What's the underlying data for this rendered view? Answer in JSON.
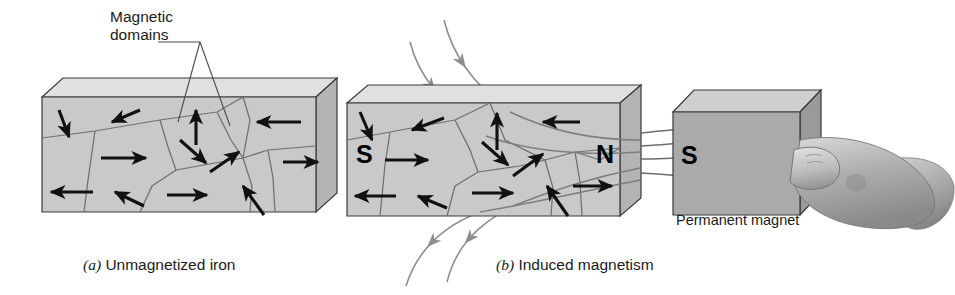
{
  "figure": {
    "width": 955,
    "height": 295,
    "background": "#ffffff"
  },
  "labels": {
    "magnetic_domains": "Magnetic\ndomains",
    "permanent_magnet": "Permanent magnet"
  },
  "captions": {
    "panel_a_index": "(a)",
    "panel_a_text": "Unmagnetized iron",
    "panel_b_index": "(b)",
    "panel_b_text": "Induced magnetism"
  },
  "poles": {
    "block_left": "S",
    "block_right": "N",
    "magnet_left": "S"
  },
  "colors": {
    "front_face": "#c9c9c9",
    "front_face_light": "#d8d8d8",
    "top_face": "#e0e0e0",
    "side_face": "#b4b4b4",
    "magnet_front": "#aaaaaa",
    "magnet_top": "#cfcfcf",
    "magnet_side": "#9a9a9a",
    "domain_line": "#6f6f6f",
    "arrow": "#111111",
    "field_line": "#8d8d8d",
    "hand_light": "#cfcfcf",
    "hand_mid": "#a8a8a8",
    "hand_dark": "#808080",
    "outline": "#3a3a3a",
    "text": "#1a1a1a"
  },
  "panel_a": {
    "name": "unmagnetized-iron-block",
    "block": {
      "front": "42,97 316,97 316,212 42,212",
      "top": "42,97 63,78 337,78 316,97",
      "side": "316,97 337,78 337,193 316,212"
    },
    "domain_lines": [
      "42,138 95,131 160,120 217,112 243,97",
      "95,131 88,180 84,212",
      "160,120 168,147 176,170",
      "176,170 152,186 140,212",
      "176,170 215,163 243,158",
      "217,112 231,140 243,158",
      "243,158 268,150 316,146",
      "243,158 252,186 250,212",
      "268,150 273,178 275,212",
      "243,97 250,120 243,158"
    ],
    "arrows": [
      {
        "name": "domain-arrow-down-left",
        "x1": 59,
        "y1": 110,
        "x2": 69,
        "y2": 137
      },
      {
        "name": "domain-arrow-up-left",
        "x1": 140,
        "y1": 110,
        "x2": 112,
        "y2": 122
      },
      {
        "name": "domain-arrow-up",
        "x1": 196,
        "y1": 145,
        "x2": 196,
        "y2": 110
      },
      {
        "name": "domain-arrow-left-top",
        "x1": 301,
        "y1": 122,
        "x2": 257,
        "y2": 122
      },
      {
        "name": "domain-arrow-right-mid",
        "x1": 101,
        "y1": 158,
        "x2": 146,
        "y2": 158
      },
      {
        "name": "domain-arrow-downright",
        "x1": 180,
        "y1": 140,
        "x2": 206,
        "y2": 163
      },
      {
        "name": "domain-arrow-upright",
        "x1": 210,
        "y1": 172,
        "x2": 239,
        "y2": 152
      },
      {
        "name": "domain-arrow-right-east",
        "x1": 283,
        "y1": 162,
        "x2": 318,
        "y2": 162
      },
      {
        "name": "domain-arrow-left-bottom",
        "x1": 93,
        "y1": 192,
        "x2": 51,
        "y2": 192
      },
      {
        "name": "domain-arrow-downleft-bottom",
        "x1": 144,
        "y1": 206,
        "x2": 115,
        "y2": 192
      },
      {
        "name": "domain-arrow-right-bottom",
        "x1": 167,
        "y1": 195,
        "x2": 207,
        "y2": 195
      },
      {
        "name": "domain-arrow-upleft-bottom",
        "x1": 264,
        "y1": 215,
        "x2": 243,
        "y2": 186
      }
    ],
    "leader_lines": [
      "158,42 200,42",
      "200,42 178,122",
      "200,42 230,126"
    ]
  },
  "panel_b": {
    "name": "induced-magnetism-block",
    "block": {
      "front": "347,103 620,103 620,216 347,216",
      "top": "347,103 368,85 641,85 620,103",
      "side": "620,103 641,85 641,198 620,216"
    },
    "domain_lines": [
      "347,140 390,132 455,120 490,103",
      "390,132 385,165 380,216",
      "455,120 470,150 478,172",
      "478,172 455,186 447,216",
      "478,172 520,166 545,160",
      "490,103 505,140 545,160",
      "545,160 575,152 620,148",
      "545,160 553,188 551,216",
      "575,152 580,182 582,216",
      "620,148 600,160 575,152"
    ],
    "arrows": [
      {
        "name": "domain-arrow-down-left-b",
        "x1": 360,
        "y1": 112,
        "x2": 372,
        "y2": 140
      },
      {
        "name": "domain-arrow-upleft-b",
        "x1": 444,
        "y1": 118,
        "x2": 412,
        "y2": 130
      },
      {
        "name": "domain-arrow-up-b",
        "x1": 497,
        "y1": 150,
        "x2": 497,
        "y2": 113
      },
      {
        "name": "domain-arrow-left-top-b",
        "x1": 580,
        "y1": 122,
        "x2": 543,
        "y2": 122
      },
      {
        "name": "domain-arrow-right-s",
        "x1": 385,
        "y1": 160,
        "x2": 428,
        "y2": 160
      },
      {
        "name": "domain-arrow-downright-b",
        "x1": 482,
        "y1": 142,
        "x2": 508,
        "y2": 165
      },
      {
        "name": "domain-arrow-upright-b",
        "x1": 513,
        "y1": 176,
        "x2": 543,
        "y2": 154
      },
      {
        "name": "domain-arrow-right-n",
        "x1": 573,
        "y1": 186,
        "x2": 612,
        "y2": 186
      },
      {
        "name": "domain-arrow-left-bottom-b",
        "x1": 396,
        "y1": 196,
        "x2": 355,
        "y2": 196
      },
      {
        "name": "domain-arrow-downleft-bottom-b",
        "x1": 447,
        "y1": 208,
        "x2": 418,
        "y2": 196
      },
      {
        "name": "domain-arrow-right-bottom-b",
        "x1": 472,
        "y1": 193,
        "x2": 513,
        "y2": 193
      },
      {
        "name": "domain-arrow-upleft-bottom-b",
        "x1": 568,
        "y1": 216,
        "x2": 547,
        "y2": 186
      }
    ],
    "field_lines_outside": [
      {
        "name": "field-line-top-1",
        "d": "M 444,20 C 452,52 470,82 510,112",
        "arrow_at": 0.42,
        "direction": "in"
      },
      {
        "name": "field-line-top-2",
        "d": "M 410,42 C 418,74 440,104 486,136",
        "arrow_at": 0.42,
        "direction": "in"
      },
      {
        "name": "field-line-bottom-1",
        "d": "M 447,282 C 455,250 474,226 513,206",
        "arrow_at": 0.45,
        "direction": "out"
      },
      {
        "name": "field-line-bottom-2",
        "d": "M 406,286 C 416,254 438,228 480,212",
        "arrow_at": 0.45,
        "direction": "out"
      }
    ],
    "field_lines_internal": [
      "M 510,112 C 556,134 600,140 640,140",
      "M 486,136 C 530,152 590,156 640,152",
      "M 513,206 C 552,190 600,176 640,168",
      "M 480,212 C 528,204 590,190 640,180"
    ],
    "field_lines_gap": [
      "M 641,133 C 658,131 670,130 681,129",
      "M 641,146 C 658,145 670,144 681,143",
      "M 641,159 C 658,159 670,158 681,158",
      "M 641,173 C 658,174 670,175 681,176"
    ]
  },
  "magnet": {
    "name": "permanent-magnet",
    "front": "673,112 800,112 800,215 673,215",
    "top": "673,112 694,90 821,90 800,112",
    "side": "800,112 821,90 821,193 800,215"
  },
  "hand": {
    "name": "hand-holding-magnet",
    "thumb": "M 794,150 C 812,144 828,148 836,158 C 843,168 840,180 828,186 C 814,192 798,190 790,182 Z",
    "palm": "M 800,140 C 840,132 886,144 912,166 C 934,184 940,204 930,216 C 918,230 880,232 848,224 C 818,216 798,200 794,182 Z",
    "wrist": "M 900,158 C 930,156 950,168 954,186 C 955,206 944,222 926,228 C 912,232 900,226 898,214 Z",
    "knuckle": "M 848,176 C 856,172 864,174 866,180 C 868,187 862,192 854,191 C 847,190 843,182 848,176 Z"
  }
}
